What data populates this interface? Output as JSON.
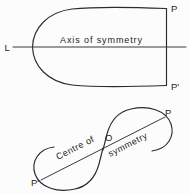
{
  "figure": {
    "background_color": "#fcfcfd",
    "ink_color": "#2b2b2d",
    "upper": {
      "name": "line-symmetry-figure",
      "axis_label": "Axis of symmetry",
      "left_point_label": "L",
      "top_point_label": "P",
      "bottom_point_label": "P'"
    },
    "lower": {
      "name": "point-symmetry-figure",
      "centre_label_part1": "Centre of",
      "centre_label_part2": "symmetry",
      "origin_label": "O",
      "upper_point_label": "P",
      "lower_point_label": "P'"
    }
  }
}
